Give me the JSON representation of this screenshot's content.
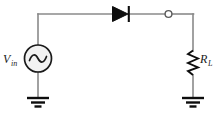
{
  "diagram": {
    "type": "schematic",
    "background_color": "#ffffff",
    "wire_color": "#8a8a8a",
    "component_color": "#1a1a1a",
    "width": 224,
    "height": 122
  },
  "labels": {
    "source": {
      "symbol": "V",
      "subscript": "in",
      "full": "V_in"
    },
    "load": {
      "symbol": "R",
      "subscript": "L",
      "full": "R_L"
    }
  },
  "components": [
    {
      "id": "ac-source",
      "kind": "ac-voltage-source",
      "label": "V_in",
      "shape": "circle-with-sine"
    },
    {
      "id": "diode",
      "kind": "diode",
      "label": "",
      "shape": "triangle-with-bar",
      "orientation": "anode-left-cathode-right"
    },
    {
      "id": "output-node",
      "kind": "terminal-node",
      "label": "",
      "shape": "open-circle"
    },
    {
      "id": "load-resistor",
      "kind": "resistor",
      "label": "R_L",
      "shape": "zigzag"
    },
    {
      "id": "ground-left",
      "kind": "ground",
      "label": "",
      "shape": "three-bars"
    },
    {
      "id": "ground-right",
      "kind": "ground",
      "label": "",
      "shape": "three-bars"
    }
  ]
}
